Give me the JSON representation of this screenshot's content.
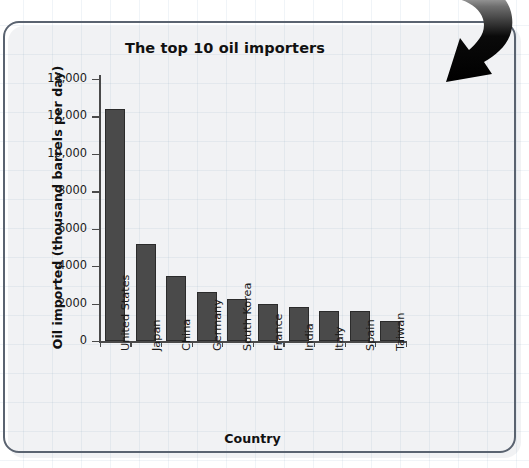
{
  "chart_data": {
    "type": "bar",
    "title": "The top 10 oil importers",
    "xlabel": "Country",
    "ylabel": "Oil imported (thousand barrels per day)",
    "categories": [
      "United States",
      "Japan",
      "China",
      "Germany",
      "South Korea",
      "France",
      "India",
      "Italy",
      "Spain",
      "Taiwan"
    ],
    "values": [
      12400,
      5200,
      3500,
      2600,
      2250,
      2000,
      1800,
      1600,
      1600,
      1050
    ],
    "ylim": [
      0,
      14000
    ],
    "ytick_labels": [
      "14,000",
      "12,000",
      "10,000",
      "8000",
      "6000",
      "4000",
      "2000",
      "0"
    ],
    "ytick_values": [
      14000,
      12000,
      10000,
      8000,
      6000,
      4000,
      2000,
      0
    ],
    "grid": false,
    "legend": "none",
    "bar_color": "#4a4a4a",
    "axis_color": "#4a4a4a"
  },
  "decoration": {
    "arrow_icon": "curved-down-arrow",
    "arrow_color": "#000000",
    "panel_border_color": "#5a6370"
  }
}
